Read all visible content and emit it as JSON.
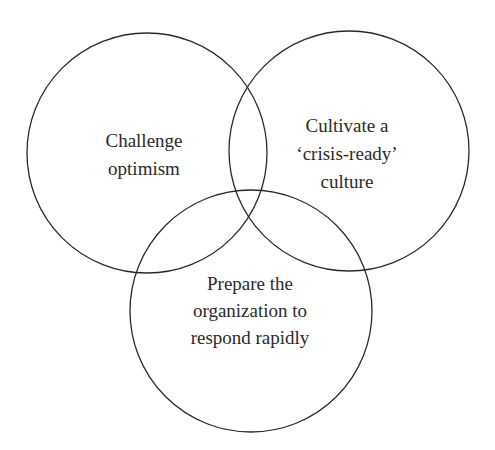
{
  "diagram": {
    "type": "venn",
    "circles": [
      {
        "id": "left",
        "lines": [
          "Challenge",
          "optimism"
        ]
      },
      {
        "id": "right",
        "lines": [
          "Cultivate a",
          "‘crisis-ready’",
          "culture"
        ]
      },
      {
        "id": "bottom",
        "lines": [
          "Prepare the",
          "organization to",
          "respond rapidly"
        ]
      }
    ],
    "stroke_color": "#2a2a2a",
    "text_color": "#2b2b2b"
  }
}
